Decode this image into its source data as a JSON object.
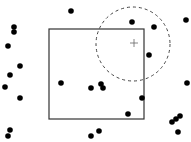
{
  "diagram": {
    "background": "#ffffff",
    "dot_color": "#000000",
    "dot_radius": 2.8,
    "square": {
      "x": 49,
      "y": 29,
      "width": 95,
      "height": 90,
      "stroke": "#333333"
    },
    "circle": {
      "cx": 133,
      "cy": 44,
      "r": 37,
      "stroke": "#444444",
      "dash": "3,3"
    },
    "crosshair": {
      "x": 134,
      "y": 43,
      "size": 4,
      "stroke": "#666666"
    },
    "dots": [
      [
        71,
        11
      ],
      [
        14,
        27
      ],
      [
        14,
        32
      ],
      [
        8,
        46
      ],
      [
        20,
        66
      ],
      [
        10,
        75
      ],
      [
        5,
        87
      ],
      [
        20,
        98
      ],
      [
        10,
        130
      ],
      [
        8,
        136
      ],
      [
        61,
        83
      ],
      [
        91,
        88
      ],
      [
        101,
        84
      ],
      [
        103,
        88
      ],
      [
        128,
        114
      ],
      [
        99,
        131
      ],
      [
        91,
        136
      ],
      [
        142,
        98
      ],
      [
        132,
        22
      ],
      [
        154,
        27
      ],
      [
        186,
        20
      ],
      [
        149,
        55
      ],
      [
        187,
        83
      ],
      [
        172,
        122
      ],
      [
        176,
        119
      ],
      [
        180,
        116
      ],
      [
        178,
        132
      ]
    ]
  }
}
